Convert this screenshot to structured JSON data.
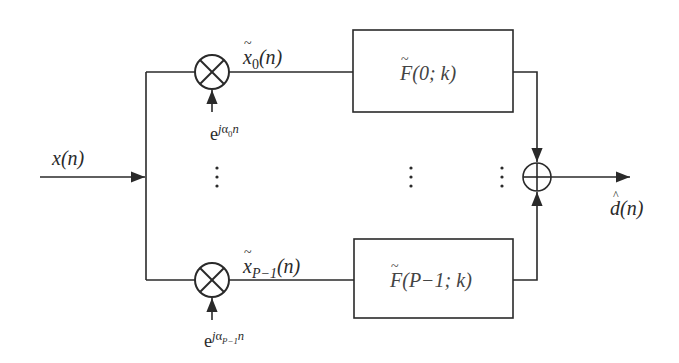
{
  "diagram": {
    "type": "block-diagram",
    "input": {
      "label": "x(n)"
    },
    "output": {
      "label": "d̂(n)",
      "label_base": "d",
      "label_arg": "(n)"
    },
    "branches": [
      {
        "index": 0,
        "multiplier_symbol": "⊗",
        "modulator": {
          "base": "e",
          "exp_j": "j",
          "exp_alpha": "α",
          "exp_sub": "0",
          "exp_n": "n",
          "text": "e^{jα₀n}"
        },
        "signal": {
          "base": "x",
          "sub": "0",
          "arg": "(n)",
          "text": "x̃₀(n)"
        },
        "filter": {
          "base": "F",
          "arg": "(0; k)",
          "text": "F̃(0; k)"
        }
      },
      {
        "index": "P-1",
        "multiplier_symbol": "⊗",
        "modulator": {
          "base": "e",
          "exp_j": "j",
          "exp_alpha": "α",
          "exp_sub": "P−1",
          "exp_n": "n",
          "text": "e^{jα_{P−1}n}"
        },
        "signal": {
          "base": "x",
          "sub": "P−1",
          "arg": "(n)",
          "text": "x̃_{P−1}(n)"
        },
        "filter": {
          "base": "F",
          "arg": "(P−1; k)",
          "text": "F̃(P−1; k)"
        }
      }
    ],
    "ellipsis": "⋮",
    "summer_symbol": "⊕",
    "colors": {
      "line": "#2a2a2a",
      "background": "#ffffff"
    }
  }
}
